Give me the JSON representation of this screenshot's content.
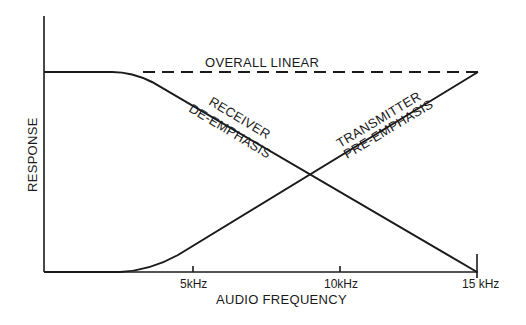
{
  "diagram": {
    "x_axis": {
      "label": "AUDIO FREQUENCY",
      "ticks": [
        {
          "label": "5kHz",
          "value": 5
        },
        {
          "label": "10kHz",
          "value": 10
        },
        {
          "label": "15 kHz",
          "value": 15
        }
      ]
    },
    "y_axis": {
      "label": "RESPONSE"
    },
    "curves": {
      "overall": {
        "label": "OVERALL LINEAR",
        "style": "dashed"
      },
      "receiver": {
        "label_line1": "RECEIVER",
        "label_line2": "DE-EMPHASIS",
        "style": "solid"
      },
      "transmitter": {
        "label_line1": "TRANSMITTER",
        "label_line2": "PRE-EMPHASIS",
        "style": "solid"
      }
    },
    "colors": {
      "line": "#1a1a1a",
      "background": "#ffffff"
    }
  }
}
